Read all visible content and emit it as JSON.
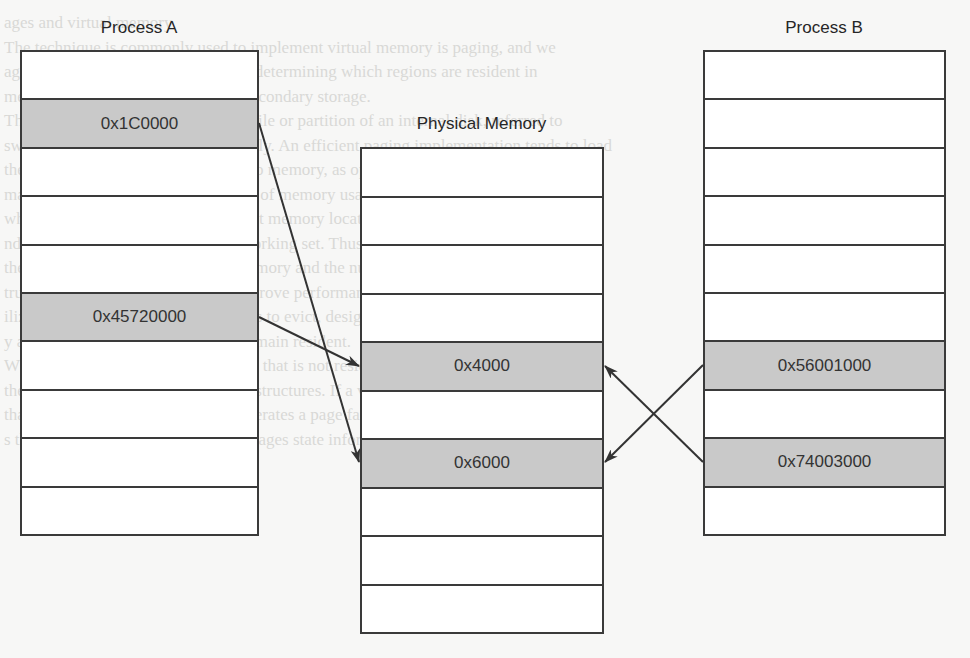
{
  "diagram": {
    "process_a": {
      "title": "Process A",
      "rows": [
        "",
        "0x1C0000",
        "",
        "",
        "",
        "0x45720000",
        "",
        "",
        "",
        ""
      ],
      "shaded": [
        1,
        5
      ]
    },
    "physical_memory": {
      "title": "Physical Memory",
      "rows": [
        "",
        "",
        "",
        "",
        "0x4000",
        "",
        "0x6000",
        "",
        "",
        ""
      ],
      "shaded": [
        4,
        6
      ]
    },
    "process_b": {
      "title": "Process B",
      "rows": [
        "",
        "",
        "",
        "",
        "",
        "",
        "0x56001000",
        "",
        "0x74003000",
        ""
      ],
      "shaded": [
        6,
        8
      ]
    },
    "mappings": [
      {
        "from": "Process A 0x1C0000",
        "to": "Physical Memory 0x6000"
      },
      {
        "from": "Process A 0x45720000",
        "to": "Physical Memory 0x4000"
      },
      {
        "from": "Process B 0x56001000",
        "to": "Physical Memory 0x6000"
      },
      {
        "from": "Process B 0x74003000",
        "to": "Physical Memory 0x4000"
      }
    ]
  },
  "background_text": [
    "ages and virtual memory",
    "The technique is commonly used to implement virtual memory is paging, and we",
    "age memory management policy for determining which regions are resident in",
    "memory and which are moved to a secondary storage.",
    "The common secondary storage is a file or partition of an internal disk, referred to",
    "swap file or swap partition respectively. An efficient paging implementation tends to load",
    "the pages that are actually needed into memory, as opposed to entire processes.",
    "mand paging is, for the characteristic of memory usage known as locality of refer-",
    "which is based on the observation that memory locations are likely to be accessed",
    "ndomly at the same time, as in the working set. Thus demand paging reduces",
    "the number of pages brought into memory and the number of processes that",
    "truly resident at any one time. To improve performance, an OS will, however,",
    "ilize its policy to choose, which pages to evict, designating which regions of",
    "y are paged versus those that must remain resident.",
    "When a process tries to access a page that is not resident, the hardware",
    "the process or discussed paging data structures. If a valid attempt to access",
    "that is not resident, the hardware generates a page fault. While the hardware",
    "s the fault, the operating system leverages state information encoded in"
  ]
}
